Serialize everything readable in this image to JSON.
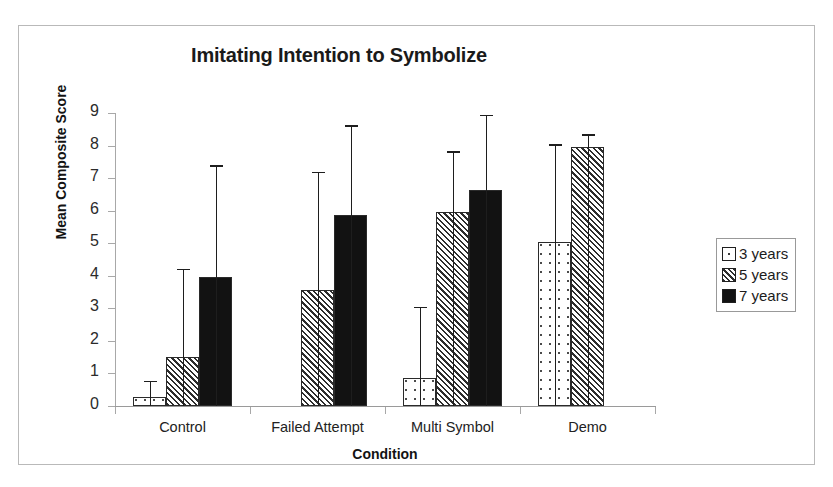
{
  "chart_data": {
    "type": "bar",
    "title": "Imitating Intention to Symbolize",
    "xlabel": "Condition",
    "ylabel": "Mean Composite Score",
    "categories": [
      "Control",
      "Failed Attempt",
      "Multi Symbol",
      "Demo"
    ],
    "ylim": [
      0,
      9
    ],
    "yticks": [
      0,
      1,
      2,
      3,
      4,
      5,
      6,
      7,
      8,
      9
    ],
    "ytick_labels": [
      "0",
      "1",
      "2",
      "3",
      "4",
      "5",
      "6",
      "7",
      "8",
      "9"
    ],
    "grid": false,
    "legend_position": "right",
    "error_bars": "upper-only",
    "series": [
      {
        "name": "3 years",
        "fill": "dotted",
        "values": [
          0.28,
          0.0,
          0.85,
          5.05
        ],
        "error_upper": [
          0.78,
          0.0,
          3.05,
          8.05
        ]
      },
      {
        "name": "5 years",
        "fill": "diagonal-hatch",
        "values": [
          1.5,
          3.55,
          5.95,
          7.95
        ],
        "error_upper": [
          4.22,
          7.2,
          7.82,
          8.35
        ]
      },
      {
        "name": "7 years",
        "fill": "solid-black",
        "values": [
          3.95,
          5.88,
          6.62,
          0.0
        ],
        "error_upper": [
          7.4,
          8.62,
          8.95,
          0.0
        ]
      }
    ]
  },
  "legend": {
    "items": [
      {
        "label": "3 years"
      },
      {
        "label": "5 years"
      },
      {
        "label": "7 years"
      }
    ]
  },
  "colors": {
    "frame": "#b9b9b9",
    "axis": "#a8a8a8",
    "text": "#1a1a1a",
    "series_7_years": "#121212"
  }
}
